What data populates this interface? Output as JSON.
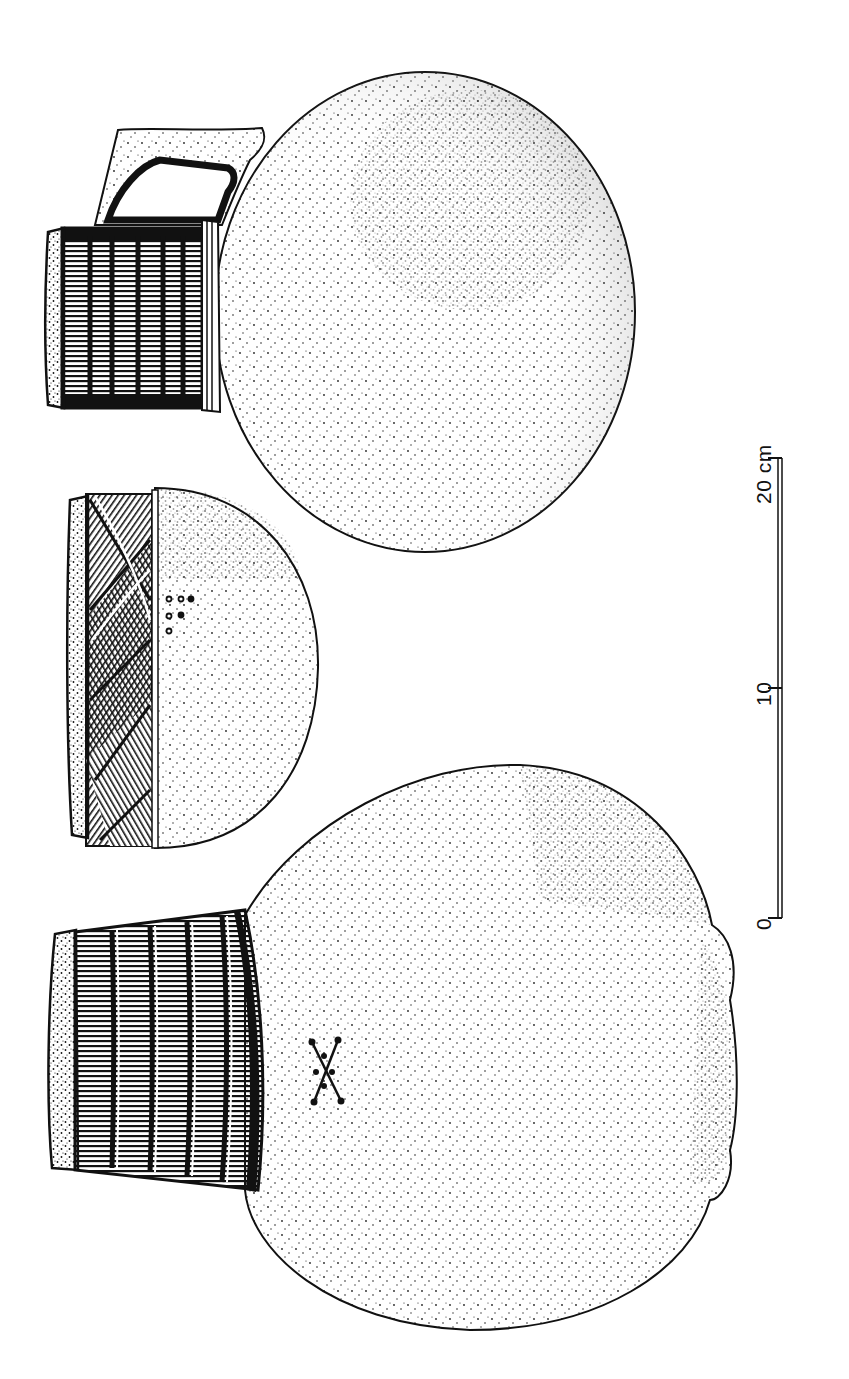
{
  "figure": {
    "background": "#ffffff",
    "ink": "#111111"
  },
  "vessels": [
    {
      "id": "jug-with-handle",
      "name": "Handled flask (top)",
      "body": {
        "cx": 425,
        "cy": 312,
        "rx": 210,
        "ry": 240
      },
      "neck": {
        "x": 45,
        "y": 225,
        "w": 175,
        "h": 185
      },
      "neck_bands": 5,
      "handle": true
    },
    {
      "id": "bowl",
      "name": "Bowl (middle)",
      "rim": {
        "x": 68,
        "y": 500,
        "w": 18,
        "h": 335
      },
      "band": {
        "x": 86,
        "y": 492,
        "w": 72,
        "h": 355
      },
      "body": {
        "cx": 160,
        "cy": 668,
        "rx": 158,
        "ry": 183
      },
      "dot_marks": 6
    },
    {
      "id": "flask",
      "name": "Large flask (bottom)",
      "body": {
        "cx": 455,
        "cy": 1050,
        "rx": 275,
        "ry": 280
      },
      "neck": {
        "x": 50,
        "y": 930,
        "w": 215,
        "h": 240
      },
      "neck_bands": 6,
      "mark": "X with dots"
    }
  ],
  "scale_bar": {
    "unit": "cm",
    "labels": [
      "0",
      "10",
      "20 cm"
    ],
    "values": [
      0,
      10,
      20
    ],
    "positions_y": [
      918,
      688,
      458
    ],
    "x": 780
  }
}
